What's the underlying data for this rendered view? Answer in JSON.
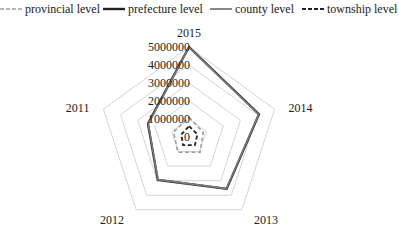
{
  "chart_data": {
    "type": "radar",
    "title": "",
    "categories": [
      "2015",
      "2014",
      "2013",
      "2012",
      "2011"
    ],
    "axis": {
      "ticks": [
        0,
        1000000,
        2000000,
        3000000,
        4000000,
        5000000
      ],
      "tick_labels": [
        "0",
        "1000000",
        "2000000",
        "3000000",
        "4000000",
        "5000000"
      ],
      "range": [
        0,
        5000000
      ],
      "grid": true
    },
    "legend_position": "top",
    "series": [
      {
        "name": "provincial level",
        "color": "#a0a0a0",
        "style": "dashed",
        "width": 1.6,
        "values": [
          1100000,
          830000,
          1050000,
          1050000,
          900000
        ]
      },
      {
        "name": "prefecture level",
        "color": "#222222",
        "style": "solid",
        "width": 2.2,
        "values": [
          5000000,
          4090000,
          3560000,
          2950000,
          2400000
        ]
      },
      {
        "name": "county level",
        "color": "#7a7a7a",
        "style": "solid",
        "width": 1.6,
        "values": [
          4980000,
          4070000,
          3540000,
          2930000,
          2380000
        ]
      },
      {
        "name": "township level",
        "color": "#222222",
        "style": "dashed",
        "width": 1.8,
        "values": [
          600000,
          490000,
          560000,
          560000,
          450000
        ]
      }
    ]
  },
  "legend": [
    {
      "label": "provincial level"
    },
    {
      "label": "prefecture level"
    },
    {
      "label": "county level"
    },
    {
      "label": "township level"
    }
  ]
}
